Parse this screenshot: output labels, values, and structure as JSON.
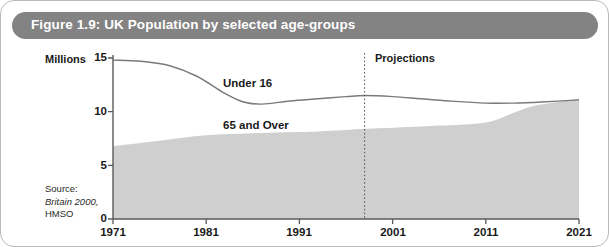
{
  "figure": {
    "title": "Figure 1.9: UK Population by selected age-groups",
    "banner_color": "#838383",
    "frame_color": "#b9b9b9"
  },
  "source": {
    "line1": "Source:",
    "line2": "Britain 2000,",
    "line3": "HMSO"
  },
  "annotations": {
    "projections": "Projections",
    "under16": "Under 16",
    "over65": "65 and Over"
  },
  "axis": {
    "ylabel": "Millions",
    "yticks": [
      "15",
      "10",
      "5",
      "0"
    ],
    "xticks": [
      "1971",
      "1981",
      "1991",
      "2001",
      "2011",
      "2021"
    ]
  },
  "chart_data": {
    "type": "line",
    "title": "Figure 1.9: UK Population by selected age-groups",
    "xlabel": "",
    "ylabel": "Millions",
    "xlim": [
      1971,
      2021
    ],
    "ylim": [
      0,
      15
    ],
    "yticks": [
      0,
      5,
      10,
      15
    ],
    "xticks": [
      1971,
      1981,
      1991,
      2001,
      2011,
      2021
    ],
    "grid": false,
    "legend": "inline-labels",
    "projection_start_year": 1998,
    "series": [
      {
        "name": "Under 16",
        "render": "line",
        "color": "#7a7a7a",
        "x": [
          1971,
          1974,
          1977,
          1980,
          1983,
          1985,
          1987,
          1990,
          1993,
          1996,
          1998,
          2001,
          2004,
          2007,
          2011,
          2014,
          2017,
          2021
        ],
        "values": [
          14.8,
          14.7,
          14.3,
          13.3,
          11.7,
          10.9,
          10.7,
          11.0,
          11.2,
          11.4,
          11.5,
          11.4,
          11.2,
          11.0,
          10.8,
          10.8,
          10.9,
          11.1
        ]
      },
      {
        "name": "65 and Over",
        "render": "area",
        "color": "#cfcfcf",
        "x": [
          1971,
          1976,
          1981,
          1986,
          1991,
          1996,
          1998,
          2001,
          2006,
          2011,
          2014,
          2016,
          2018,
          2021
        ],
        "values": [
          6.8,
          7.3,
          7.8,
          8.0,
          8.1,
          8.3,
          8.4,
          8.5,
          8.7,
          9.0,
          9.9,
          10.5,
          10.8,
          11.2
        ]
      }
    ]
  }
}
